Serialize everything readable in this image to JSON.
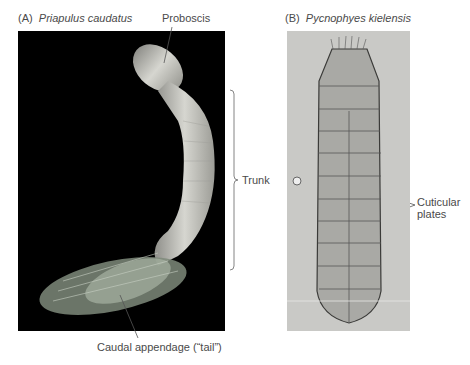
{
  "figure": {
    "panel_a": {
      "letter": "(A)",
      "species": "Priapulus caudatus",
      "labels": {
        "proboscis": "Proboscis",
        "trunk": "Trunk",
        "caudal": "Caudal appendage (“tail”)"
      }
    },
    "panel_b": {
      "letter": "(B)",
      "species": "Pycnophyes kielensis",
      "labels": {
        "cuticular_line1": "Cuticular",
        "cuticular_line2": "plates"
      }
    }
  }
}
